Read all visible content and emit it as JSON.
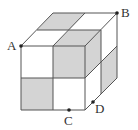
{
  "diagram": {
    "colors": {
      "stroke": "#555555",
      "shade": "#d4d4d4",
      "point": "#222222",
      "background": "#ffffff"
    },
    "labels": [
      {
        "id": "A",
        "text": "A",
        "x": 7,
        "y": 39
      },
      {
        "id": "B",
        "text": "B",
        "x": 121,
        "y": 6
      },
      {
        "id": "C",
        "text": "C",
        "x": 64,
        "y": 114
      },
      {
        "id": "D",
        "text": "D",
        "x": 95,
        "y": 102
      }
    ],
    "points": [
      {
        "id": "A",
        "x": 21,
        "y": 46
      },
      {
        "id": "B",
        "x": 117,
        "y": 13
      },
      {
        "id": "C",
        "x": 69,
        "y": 110
      },
      {
        "id": "D",
        "x": 93,
        "y": 102
      }
    ],
    "shaded_faces": [
      "top face back-left square",
      "front face top-right square (raised small cube)",
      "small cube top face",
      "small cube right face",
      "front face bottom-left square",
      "right face bottom-back square"
    ]
  }
}
